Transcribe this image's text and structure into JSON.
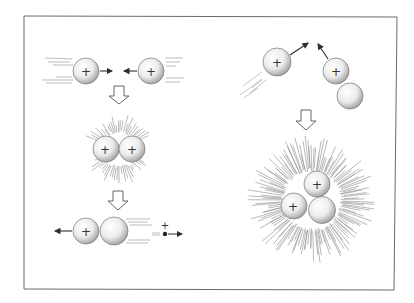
{
  "diagram": {
    "type": "nuclear-fusion-illustration",
    "frame": {
      "stroke": "#6b6b6b"
    },
    "colors": {
      "ink": "#3a3a3a",
      "ray": "#8a8a8a",
      "sphere_light": "#ffffff",
      "sphere_mid": "#e6e6e6",
      "sphere_dark": "#9a9a9a"
    },
    "proton_label": "+",
    "positron_label": "+",
    "left_sequence": {
      "step1": {
        "description": "two protons approaching",
        "particles": [
          "proton",
          "proton"
        ]
      },
      "step2": {
        "description": "protons fusing with energy burst",
        "particles": [
          "proton",
          "proton"
        ]
      },
      "step3": {
        "description": "deuteron formed; positron emitted",
        "particles": [
          "proton",
          "neutron",
          "positron"
        ]
      }
    },
    "right_sequence": {
      "step1": {
        "description": "proton approaching deuteron",
        "particles": [
          "proton",
          "proton",
          "neutron"
        ]
      },
      "step2": {
        "description": "helium-3 nucleus formed with energy burst",
        "particles": [
          "proton",
          "proton",
          "neutron"
        ]
      }
    }
  }
}
